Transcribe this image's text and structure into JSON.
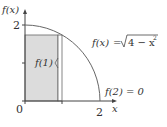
{
  "diagram": {
    "y_axis_label": "f(x)",
    "x_axis_label": "x",
    "y_tick_label": "2",
    "x_tick_label": "2",
    "origin_label": "0",
    "function_label": "f(x) = √4 − x²",
    "function_lhs": "f(x)",
    "function_eq": "=",
    "function_rhs": "4 − x",
    "function_exp": "2",
    "rect_height_label": "f(1)",
    "endpoint_label": "f(2) = 0",
    "colors": {
      "rect_fill": "#dcdcdc",
      "lines": "#555555",
      "curve": "#666666"
    }
  }
}
